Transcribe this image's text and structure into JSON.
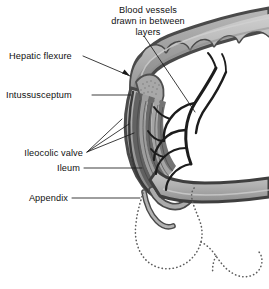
{
  "figure": {
    "background_color": "#ffffff",
    "width": 269,
    "height": 289
  },
  "labels": {
    "blood_vessels_line1": "Blood vessels",
    "blood_vessels_line2": "drawn in between",
    "blood_vessels_line3": "layers",
    "hepatic_flexure": "Hepatic flexure",
    "intussusceptum": "Intussusceptum",
    "ileocolic_valve": "Ileocolic valve",
    "ileum": "Ileum",
    "appendix": "Appendix"
  },
  "colors": {
    "outline_dark": "#4a4a4a",
    "outline_darker": "#3a3a3a",
    "wall_mid_gray": "#9a9a9a",
    "wall_light_gray": "#c4c4c4",
    "lumen_light": "#d8d8d8",
    "vessel_black": "#1c1c1c",
    "dotted_gray": "#5d5d5d",
    "text_black": "#111111"
  },
  "anatomy": {
    "parts": [
      "transverse colon",
      "hepatic flexure",
      "intussusceptum",
      "intussuscipiens",
      "ileocolic valve",
      "ileum",
      "appendix",
      "mesenteric blood vessels",
      "dotted outline of original cecum position"
    ]
  }
}
